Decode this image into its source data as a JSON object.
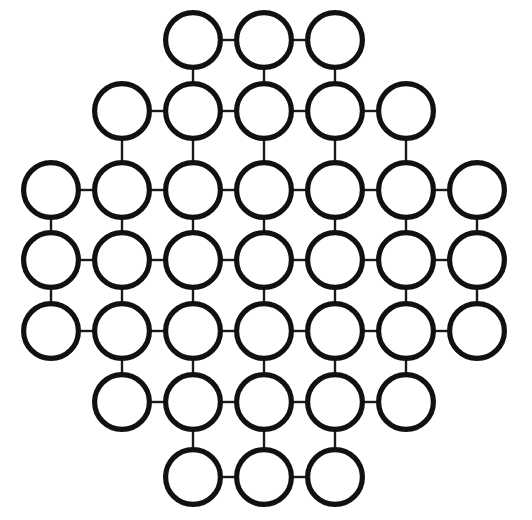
{
  "figure": {
    "name": "hexagonal-circle-lattice",
    "title": "",
    "canvas": {
      "width": 532,
      "height": 520
    },
    "background_color": "#ffffff",
    "node_stroke_color": "#111111",
    "node_fill_color": "#ffffff",
    "node_stroke_width": 5.2,
    "edge_stroke_color": "#1a1a1a",
    "edge_stroke_width": 2.4,
    "node_radius": 30,
    "column_spacing": 71,
    "row_spacing": 71,
    "node_count": 37,
    "edge_count": 84,
    "row_counts": [
      3,
      5,
      7,
      7,
      7,
      5,
      3
    ],
    "row_y": [
      40,
      111,
      190,
      260,
      331,
      402,
      477
    ],
    "column_x": [
      51,
      122,
      193,
      264,
      335,
      406,
      477
    ],
    "rows": [
      {
        "index": 0,
        "count": 3,
        "y": 40,
        "x_centers": [
          193,
          264,
          335
        ]
      },
      {
        "index": 1,
        "count": 5,
        "y": 111,
        "x_centers": [
          122,
          193,
          264,
          335,
          406
        ]
      },
      {
        "index": 2,
        "count": 7,
        "y": 190,
        "x_centers": [
          51,
          122,
          193,
          264,
          335,
          406,
          477
        ]
      },
      {
        "index": 3,
        "count": 7,
        "y": 260,
        "x_centers": [
          51,
          122,
          193,
          264,
          335,
          406,
          477
        ]
      },
      {
        "index": 4,
        "count": 7,
        "y": 331,
        "x_centers": [
          51,
          122,
          193,
          264,
          335,
          406,
          477
        ]
      },
      {
        "index": 5,
        "count": 5,
        "y": 402,
        "x_centers": [
          122,
          193,
          264,
          335,
          406
        ]
      },
      {
        "index": 6,
        "count": 3,
        "y": 477,
        "x_centers": [
          193,
          264,
          335
        ]
      }
    ]
  },
  "chart_data": {
    "type": "scatter",
    "title": "",
    "xlabel": "",
    "ylabel": "",
    "nodes": [
      {
        "id": "r0c2",
        "row": 0,
        "col": 2,
        "x": 193,
        "y": 40
      },
      {
        "id": "r0c3",
        "row": 0,
        "col": 3,
        "x": 264,
        "y": 40
      },
      {
        "id": "r0c4",
        "row": 0,
        "col": 4,
        "x": 335,
        "y": 40
      },
      {
        "id": "r1c1",
        "row": 1,
        "col": 1,
        "x": 122,
        "y": 111
      },
      {
        "id": "r1c2",
        "row": 1,
        "col": 2,
        "x": 193,
        "y": 111
      },
      {
        "id": "r1c3",
        "row": 1,
        "col": 3,
        "x": 264,
        "y": 111
      },
      {
        "id": "r1c4",
        "row": 1,
        "col": 4,
        "x": 335,
        "y": 111
      },
      {
        "id": "r1c5",
        "row": 1,
        "col": 5,
        "x": 406,
        "y": 111
      },
      {
        "id": "r2c0",
        "row": 2,
        "col": 0,
        "x": 51,
        "y": 190
      },
      {
        "id": "r2c1",
        "row": 2,
        "col": 1,
        "x": 122,
        "y": 190
      },
      {
        "id": "r2c2",
        "row": 2,
        "col": 2,
        "x": 193,
        "y": 190
      },
      {
        "id": "r2c3",
        "row": 2,
        "col": 3,
        "x": 264,
        "y": 190
      },
      {
        "id": "r2c4",
        "row": 2,
        "col": 4,
        "x": 335,
        "y": 190
      },
      {
        "id": "r2c5",
        "row": 2,
        "col": 5,
        "x": 406,
        "y": 190
      },
      {
        "id": "r2c6",
        "row": 2,
        "col": 6,
        "x": 477,
        "y": 190
      },
      {
        "id": "r3c0",
        "row": 3,
        "col": 0,
        "x": 51,
        "y": 260
      },
      {
        "id": "r3c1",
        "row": 3,
        "col": 1,
        "x": 122,
        "y": 260
      },
      {
        "id": "r3c2",
        "row": 3,
        "col": 2,
        "x": 193,
        "y": 260
      },
      {
        "id": "r3c3",
        "row": 3,
        "col": 3,
        "x": 264,
        "y": 260
      },
      {
        "id": "r3c4",
        "row": 3,
        "col": 4,
        "x": 335,
        "y": 260
      },
      {
        "id": "r3c5",
        "row": 3,
        "col": 5,
        "x": 406,
        "y": 260
      },
      {
        "id": "r3c6",
        "row": 3,
        "col": 6,
        "x": 477,
        "y": 260
      },
      {
        "id": "r4c0",
        "row": 4,
        "col": 0,
        "x": 51,
        "y": 331
      },
      {
        "id": "r4c1",
        "row": 4,
        "col": 1,
        "x": 122,
        "y": 331
      },
      {
        "id": "r4c2",
        "row": 4,
        "col": 2,
        "x": 193,
        "y": 331
      },
      {
        "id": "r4c3",
        "row": 4,
        "col": 3,
        "x": 264,
        "y": 331
      },
      {
        "id": "r4c4",
        "row": 4,
        "col": 4,
        "x": 335,
        "y": 331
      },
      {
        "id": "r4c5",
        "row": 4,
        "col": 5,
        "x": 406,
        "y": 331
      },
      {
        "id": "r4c6",
        "row": 4,
        "col": 6,
        "x": 477,
        "y": 331
      },
      {
        "id": "r5c1",
        "row": 5,
        "col": 1,
        "x": 122,
        "y": 402
      },
      {
        "id": "r5c2",
        "row": 5,
        "col": 2,
        "x": 193,
        "y": 402
      },
      {
        "id": "r5c3",
        "row": 5,
        "col": 3,
        "x": 264,
        "y": 402
      },
      {
        "id": "r5c4",
        "row": 5,
        "col": 4,
        "x": 335,
        "y": 402
      },
      {
        "id": "r5c5",
        "row": 5,
        "col": 5,
        "x": 406,
        "y": 402
      },
      {
        "id": "r6c2",
        "row": 6,
        "col": 2,
        "x": 193,
        "y": 477
      },
      {
        "id": "r6c3",
        "row": 6,
        "col": 3,
        "x": 264,
        "y": 477
      },
      {
        "id": "r6c4",
        "row": 6,
        "col": 4,
        "x": 335,
        "y": 477
      }
    ],
    "edges": [
      [
        "r0c2",
        "r0c3"
      ],
      [
        "r0c3",
        "r0c4"
      ],
      [
        "r1c1",
        "r1c2"
      ],
      [
        "r1c2",
        "r1c3"
      ],
      [
        "r1c3",
        "r1c4"
      ],
      [
        "r1c4",
        "r1c5"
      ],
      [
        "r2c0",
        "r2c1"
      ],
      [
        "r2c1",
        "r2c2"
      ],
      [
        "r2c2",
        "r2c3"
      ],
      [
        "r2c3",
        "r2c4"
      ],
      [
        "r2c4",
        "r2c5"
      ],
      [
        "r2c5",
        "r2c6"
      ],
      [
        "r3c0",
        "r3c1"
      ],
      [
        "r3c1",
        "r3c2"
      ],
      [
        "r3c2",
        "r3c3"
      ],
      [
        "r3c3",
        "r3c4"
      ],
      [
        "r3c4",
        "r3c5"
      ],
      [
        "r3c5",
        "r3c6"
      ],
      [
        "r4c0",
        "r4c1"
      ],
      [
        "r4c1",
        "r4c2"
      ],
      [
        "r4c2",
        "r4c3"
      ],
      [
        "r4c3",
        "r4c4"
      ],
      [
        "r4c4",
        "r4c5"
      ],
      [
        "r4c5",
        "r4c6"
      ],
      [
        "r5c1",
        "r5c2"
      ],
      [
        "r5c2",
        "r5c3"
      ],
      [
        "r5c3",
        "r5c4"
      ],
      [
        "r5c4",
        "r5c5"
      ],
      [
        "r6c2",
        "r6c3"
      ],
      [
        "r6c3",
        "r6c4"
      ],
      [
        "r0c2",
        "r1c2"
      ],
      [
        "r0c3",
        "r1c3"
      ],
      [
        "r0c4",
        "r1c4"
      ],
      [
        "r1c1",
        "r2c1"
      ],
      [
        "r1c2",
        "r2c2"
      ],
      [
        "r1c3",
        "r2c3"
      ],
      [
        "r1c4",
        "r2c4"
      ],
      [
        "r1c5",
        "r2c5"
      ],
      [
        "r2c0",
        "r3c0"
      ],
      [
        "r2c1",
        "r3c1"
      ],
      [
        "r2c2",
        "r3c2"
      ],
      [
        "r2c3",
        "r3c3"
      ],
      [
        "r2c4",
        "r3c4"
      ],
      [
        "r2c5",
        "r3c5"
      ],
      [
        "r2c6",
        "r3c6"
      ],
      [
        "r3c0",
        "r4c0"
      ],
      [
        "r3c1",
        "r4c1"
      ],
      [
        "r3c2",
        "r4c2"
      ],
      [
        "r3c3",
        "r4c3"
      ],
      [
        "r3c4",
        "r4c4"
      ],
      [
        "r3c5",
        "r4c5"
      ],
      [
        "r3c6",
        "r4c6"
      ],
      [
        "r4c1",
        "r5c1"
      ],
      [
        "r4c2",
        "r5c2"
      ],
      [
        "r4c3",
        "r5c3"
      ],
      [
        "r4c4",
        "r5c4"
      ],
      [
        "r4c5",
        "r5c5"
      ],
      [
        "r5c2",
        "r6c2"
      ],
      [
        "r5c3",
        "r6c3"
      ],
      [
        "r5c4",
        "r6c4"
      ]
    ]
  }
}
